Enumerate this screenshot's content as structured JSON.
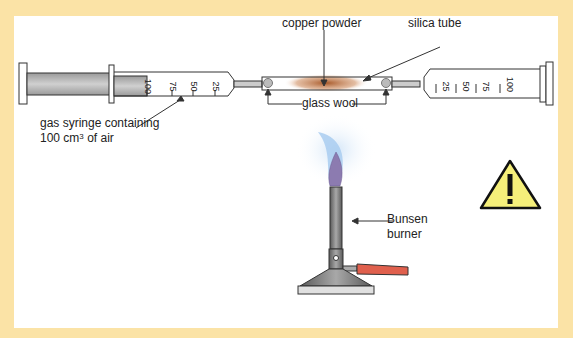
{
  "diagram": {
    "labels": {
      "copper_powder": "copper powder",
      "silica_tube": "silica tube",
      "glass_wool": "glass wool",
      "syringe_line1": "gas syringe containing",
      "syringe_line2_prefix": "100 cm",
      "syringe_line2_sup": "3",
      "syringe_line2_suffix": " of air",
      "bunsen_line1": "Bunsen",
      "bunsen_line2": "burner"
    },
    "left_syringe_scale": [
      "100",
      "75",
      "50",
      "25"
    ],
    "right_syringe_scale": [
      "25",
      "50",
      "75",
      "100"
    ],
    "warning_symbol": "!",
    "colors": {
      "border_background": "#fbe3a6",
      "panel": "#ffffff",
      "plunger": "#b8b8b8",
      "copper": "#b0622e",
      "flame_outer": "#a9cdf0",
      "flame_inner": "#8c7bb0",
      "burner_body": "#707070",
      "gas_tube": "#e0604d",
      "warning_fill": "#f5ef7a"
    }
  }
}
